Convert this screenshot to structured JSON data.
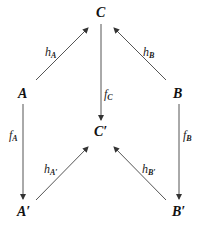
{
  "diagram": {
    "type": "commutative-diagram",
    "nodes": {
      "C": {
        "label": "C",
        "x": 100,
        "y": 17
      },
      "A": {
        "label": "A",
        "x": 23,
        "y": 98
      },
      "B": {
        "label": "B",
        "x": 178,
        "y": 98
      },
      "Cp": {
        "label": "C′",
        "x": 101,
        "y": 136
      },
      "Ap": {
        "label": "A′",
        "x": 24,
        "y": 216
      },
      "Bp": {
        "label": "B′",
        "x": 178,
        "y": 216
      }
    },
    "edges": [
      {
        "from": "A",
        "to": "C",
        "label": "h",
        "sub": "A"
      },
      {
        "from": "B",
        "to": "C",
        "label": "h",
        "sub": "B"
      },
      {
        "from": "C",
        "to": "Cp",
        "label": "f",
        "sub": "C"
      },
      {
        "from": "A",
        "to": "Ap",
        "label": "f",
        "sub": "A"
      },
      {
        "from": "B",
        "to": "Bp",
        "label": "f",
        "sub": "B"
      },
      {
        "from": "Ap",
        "to": "Cp",
        "label": "h",
        "sub": "A′"
      },
      {
        "from": "Bp",
        "to": "Cp",
        "label": "h",
        "sub": "B′"
      }
    ],
    "colors": {
      "arrow": "#555555",
      "text": "#111111",
      "background": "#ffffff"
    }
  }
}
